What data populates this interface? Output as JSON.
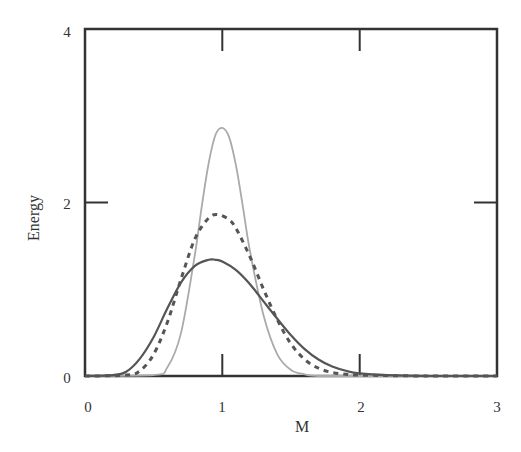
{
  "chart_data": {
    "type": "line",
    "title": "",
    "xlabel": "M",
    "ylabel": "Energy",
    "xlim": [
      0,
      3
    ],
    "ylim": [
      0,
      4
    ],
    "x_ticks": [
      "0",
      "1",
      "2",
      "3"
    ],
    "y_ticks": [
      "0",
      "2",
      "4"
    ],
    "grid": false,
    "legend": null,
    "series": [
      {
        "name": "solid-dark",
        "style": "solid",
        "color": "#555555",
        "x": [
          0.0,
          0.2,
          0.3,
          0.4,
          0.5,
          0.6,
          0.7,
          0.8,
          0.9,
          0.95,
          1.0,
          1.1,
          1.2,
          1.3,
          1.4,
          1.5,
          1.6,
          1.7,
          1.8,
          1.9,
          2.0,
          2.2,
          2.5,
          3.0
        ],
        "y": [
          0.0,
          0.01,
          0.05,
          0.2,
          0.45,
          0.78,
          1.08,
          1.27,
          1.34,
          1.34,
          1.32,
          1.22,
          1.06,
          0.86,
          0.66,
          0.47,
          0.31,
          0.19,
          0.11,
          0.06,
          0.03,
          0.01,
          0.0,
          0.0
        ]
      },
      {
        "name": "dashed-dark",
        "style": "dashed",
        "color": "#555555",
        "x": [
          0.0,
          0.3,
          0.4,
          0.5,
          0.6,
          0.7,
          0.8,
          0.9,
          0.97,
          1.05,
          1.1,
          1.2,
          1.3,
          1.4,
          1.5,
          1.6,
          1.7,
          1.8,
          1.9,
          2.0,
          2.5,
          3.0
        ],
        "y": [
          0.0,
          0.01,
          0.06,
          0.25,
          0.62,
          1.12,
          1.58,
          1.82,
          1.86,
          1.8,
          1.7,
          1.38,
          1.0,
          0.65,
          0.37,
          0.19,
          0.09,
          0.04,
          0.02,
          0.01,
          0.0,
          0.0
        ]
      },
      {
        "name": "solid-light",
        "style": "solid",
        "color": "#aaaaaa",
        "x": [
          0.0,
          0.5,
          0.6,
          0.7,
          0.8,
          0.85,
          0.9,
          0.95,
          1.0,
          1.05,
          1.1,
          1.15,
          1.2,
          1.3,
          1.4,
          1.5,
          1.6,
          1.7,
          2.0,
          3.0
        ],
        "y": [
          0.0,
          0.01,
          0.1,
          0.5,
          1.4,
          1.95,
          2.45,
          2.78,
          2.86,
          2.75,
          2.42,
          1.95,
          1.45,
          0.7,
          0.25,
          0.07,
          0.02,
          0.0,
          0.0,
          0.0
        ]
      }
    ]
  },
  "labels": {
    "xlabel": "M",
    "ylabel": "Energy",
    "x_ticks": [
      "0",
      "1",
      "2",
      "3"
    ],
    "y_ticks": [
      "0",
      "2",
      "4"
    ]
  }
}
